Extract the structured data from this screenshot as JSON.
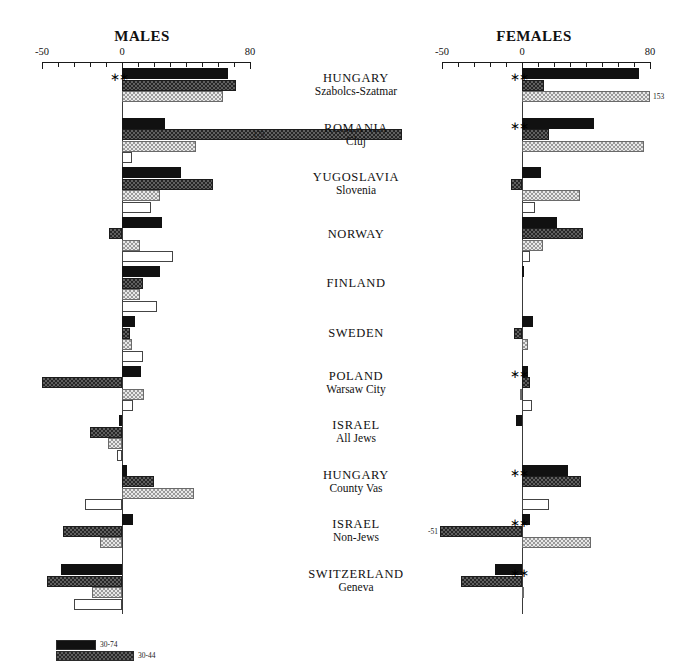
{
  "chart_data": {
    "type": "bar",
    "title": "",
    "orientation": "horizontal-diverging",
    "panels": [
      {
        "key": "males",
        "title": "MALES"
      },
      {
        "key": "females",
        "title": "FEMALES"
      }
    ],
    "xlabel": "",
    "ylabel": "",
    "xlim": [
      -50,
      80
    ],
    "xticks": [
      -50,
      -40,
      -30,
      -20,
      -10,
      0,
      10,
      20,
      30,
      40,
      50,
      60,
      70,
      80
    ],
    "xtick_labels": {
      "-50": "-50",
      "0": "0",
      "80": "80"
    },
    "grid": false,
    "legend_position": "bottom-left",
    "legend": [
      {
        "label": "30-74",
        "series": 0
      },
      {
        "label": "30-44",
        "series": 1
      }
    ],
    "series_names": [
      "30-74",
      "30-44",
      "45-59",
      "60-74"
    ],
    "categories": [
      {
        "line1": "HUNGARY",
        "line2": "Szabolcs-Szatmar"
      },
      {
        "line1": "ROMANIA",
        "line2": "Cluj"
      },
      {
        "line1": "YUGOSLAVIA",
        "line2": "Slovenia"
      },
      {
        "line1": "NORWAY",
        "line2": ""
      },
      {
        "line1": "FINLAND",
        "line2": ""
      },
      {
        "line1": "SWEDEN",
        "line2": ""
      },
      {
        "line1": "POLAND",
        "line2": "Warsaw City"
      },
      {
        "line1": "ISRAEL",
        "line2": "All Jews"
      },
      {
        "line1": "HUNGARY",
        "line2": "County Vas"
      },
      {
        "line1": "ISRAEL",
        "line2": "Non-Jews"
      },
      {
        "line1": "SWITZERLAND",
        "line2": "Geneva"
      }
    ],
    "males": {
      "values": [
        [
          66,
          71,
          63,
          0
        ],
        [
          27,
          175,
          46,
          6
        ],
        [
          37,
          57,
          24,
          18
        ],
        [
          25,
          -8,
          11,
          32
        ],
        [
          24,
          13,
          11,
          22
        ],
        [
          8,
          5,
          6,
          13
        ],
        [
          12,
          -50,
          14,
          7
        ],
        [
          -2,
          -20,
          -9,
          -3
        ],
        [
          3,
          20,
          45,
          -23
        ],
        [
          7,
          -37,
          -14,
          0
        ],
        [
          -38,
          -47,
          -19,
          -30
        ]
      ],
      "labels": [
        {
          "group": 1,
          "series": 1,
          "text": "175"
        }
      ],
      "stars": [
        {
          "group": 0,
          "between": [
            0,
            1
          ]
        }
      ]
    },
    "females": {
      "values": [
        [
          73,
          14,
          80,
          0
        ],
        [
          45,
          17,
          76,
          0
        ],
        [
          12,
          -7,
          36,
          8
        ],
        [
          22,
          38,
          13,
          5
        ],
        [
          1,
          0,
          0,
          0
        ],
        [
          7,
          -5,
          4,
          0
        ],
        [
          4,
          5,
          -1,
          6
        ],
        [
          -4,
          0,
          0,
          0
        ],
        [
          29,
          37,
          0,
          17
        ],
        [
          5,
          -51,
          43,
          0
        ],
        [
          -17,
          -38,
          1,
          0
        ]
      ],
      "labels": [
        {
          "group": 0,
          "series": 2,
          "text": "153"
        },
        {
          "group": 9,
          "series": 1,
          "text": "-51"
        }
      ],
      "stars": [
        {
          "group": 0,
          "between": [
            0,
            1
          ]
        },
        {
          "group": 1,
          "between": [
            0,
            1
          ]
        },
        {
          "group": 6,
          "between": [
            0,
            1
          ]
        },
        {
          "group": 8,
          "between": [
            0,
            1
          ]
        },
        {
          "group": 9,
          "between": [
            0,
            1
          ]
        },
        {
          "group": 10,
          "between": [
            0,
            1
          ]
        }
      ]
    },
    "star_glyph": "∗∗"
  }
}
